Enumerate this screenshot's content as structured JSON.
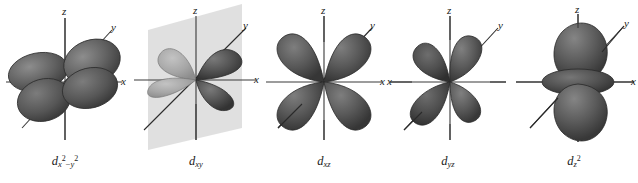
{
  "figure": {
    "background_color": "#ffffff",
    "lobe_color_dark": "#5a5a5a",
    "lobe_color_mid": "#6e6e6e",
    "lobe_color_light": "#a8a8a8",
    "lobe_edge_color": "#2e2e2e",
    "axis_color": "#3a3a3a",
    "plane_color": "#d8d8d8",
    "label_color": "#1a1a1a",
    "orbital_count": 5
  },
  "orbitals": [
    {
      "id": "dx2-y2",
      "base": "d",
      "sub": "x",
      "sup": "2",
      "minus": "−",
      "sub2": "y",
      "sup2": "2",
      "label_plain": "d x2−y2",
      "axes": {
        "z": "z",
        "y": "y",
        "x": "x"
      },
      "lobes": 4,
      "lobe_orientation": "along x and y axes",
      "has_plane": false
    },
    {
      "id": "dxy",
      "base": "d",
      "sub": "xy",
      "label_plain": "d xy",
      "axes": {
        "z": "z",
        "y": "y",
        "x": "x"
      },
      "lobes": 4,
      "lobe_orientation": "between x and y axes",
      "has_plane": true,
      "plane_note": "vertical shaded nodal plane"
    },
    {
      "id": "dxz",
      "base": "d",
      "sub": "xz",
      "label_plain": "d xz",
      "axes": {
        "z": "z",
        "y": "y",
        "x": "x"
      },
      "lobes": 4,
      "lobe_orientation": "between x and z axes",
      "has_plane": false
    },
    {
      "id": "dyz",
      "base": "d",
      "sub": "yz",
      "label_plain": "d yz",
      "axes": {
        "z": "z",
        "y": "y",
        "x": "x"
      },
      "lobes": 4,
      "lobe_orientation": "between y and z axes",
      "has_plane": false
    },
    {
      "id": "dz2",
      "base": "d",
      "sub": "z",
      "sup": "2",
      "label_plain": "d z2",
      "axes": {
        "z": "z",
        "y": "y",
        "x": "x"
      },
      "lobes": 2,
      "lobe_orientation": "along z axis with equatorial torus",
      "has_torus": true,
      "has_plane": false
    }
  ]
}
